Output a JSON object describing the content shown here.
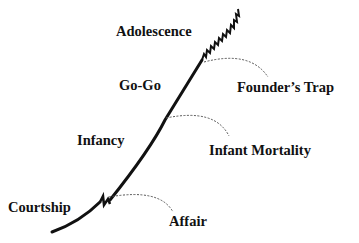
{
  "diagram": {
    "type": "organizational-lifecycle-curve",
    "colors": {
      "line": "#111111",
      "dashed": "#555555",
      "text": "#111111",
      "background": "#ffffff"
    },
    "stages": [
      {
        "id": "courtship",
        "label": "Courtship"
      },
      {
        "id": "infancy",
        "label": "Infancy"
      },
      {
        "id": "go-go",
        "label": "Go-Go"
      },
      {
        "id": "adolescence",
        "label": "Adolescence"
      }
    ],
    "pathologies": [
      {
        "id": "affair",
        "label": "Affair",
        "branches_from": "courtship"
      },
      {
        "id": "infant-mortality",
        "label": "Infant Mortality",
        "branches_from": "infancy"
      },
      {
        "id": "founders-trap",
        "label": "Founder’s Trap",
        "branches_from": "adolescence"
      }
    ]
  }
}
